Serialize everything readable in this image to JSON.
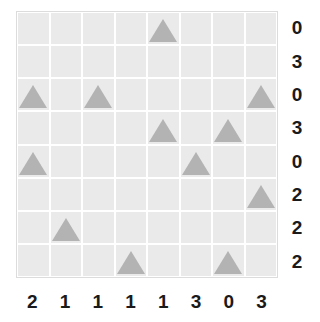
{
  "board": {
    "rows": 8,
    "cols": 8,
    "cell_background": "#eaeaea",
    "gridline_color": "#ffffff",
    "border_color": "#dcdcdc",
    "piece_icon": "triangle-icon",
    "piece_color": "#b3b3b3"
  },
  "row_clues": [
    "0",
    "3",
    "0",
    "3",
    "0",
    "2",
    "2",
    "2"
  ],
  "col_clues": [
    "2",
    "1",
    "1",
    "1",
    "1",
    "3",
    "0",
    "3"
  ],
  "cells": [
    [
      false,
      false,
      false,
      false,
      true,
      false,
      false,
      false
    ],
    [
      false,
      false,
      false,
      false,
      false,
      false,
      false,
      false
    ],
    [
      true,
      false,
      true,
      false,
      false,
      false,
      false,
      true
    ],
    [
      false,
      false,
      false,
      false,
      true,
      false,
      true,
      false
    ],
    [
      true,
      false,
      false,
      false,
      false,
      true,
      false,
      false
    ],
    [
      false,
      false,
      false,
      false,
      false,
      false,
      false,
      true
    ],
    [
      false,
      true,
      false,
      false,
      false,
      false,
      false,
      false
    ],
    [
      false,
      false,
      false,
      true,
      false,
      false,
      true,
      false
    ]
  ],
  "chart_data": {
    "type": "heatmap",
    "title": "",
    "xlabel": "",
    "ylabel": "",
    "grid": true,
    "legend": "none",
    "categories": [
      "c0",
      "c1",
      "c2",
      "c3",
      "c4",
      "c5",
      "c6",
      "c7"
    ],
    "row_labels": [
      "r0",
      "r1",
      "r2",
      "r3",
      "r4",
      "r5",
      "r6",
      "r7"
    ],
    "row_clue_values": [
      0,
      3,
      0,
      3,
      0,
      2,
      2,
      2
    ],
    "col_clue_values": [
      2,
      1,
      1,
      1,
      1,
      3,
      0,
      3
    ],
    "marker": "triangle",
    "marker_count": 12,
    "marker_positions": [
      {
        "row": 0,
        "col": 4
      },
      {
        "row": 2,
        "col": 0
      },
      {
        "row": 2,
        "col": 2
      },
      {
        "row": 2,
        "col": 7
      },
      {
        "row": 3,
        "col": 4
      },
      {
        "row": 3,
        "col": 6
      },
      {
        "row": 4,
        "col": 0
      },
      {
        "row": 4,
        "col": 5
      },
      {
        "row": 5,
        "col": 7
      },
      {
        "row": 6,
        "col": 1
      },
      {
        "row": 7,
        "col": 3
      },
      {
        "row": 7,
        "col": 6
      }
    ],
    "values": [
      [
        0,
        0,
        0,
        0,
        1,
        0,
        0,
        0
      ],
      [
        0,
        0,
        0,
        0,
        0,
        0,
        0,
        0
      ],
      [
        1,
        0,
        1,
        0,
        0,
        0,
        0,
        1
      ],
      [
        0,
        0,
        0,
        0,
        1,
        0,
        1,
        0
      ],
      [
        1,
        0,
        0,
        0,
        0,
        1,
        0,
        0
      ],
      [
        0,
        0,
        0,
        0,
        0,
        0,
        0,
        1
      ],
      [
        0,
        1,
        0,
        0,
        0,
        0,
        0,
        0
      ],
      [
        0,
        0,
        0,
        1,
        0,
        0,
        1,
        0
      ]
    ],
    "row_marker_counts": [
      1,
      0,
      3,
      2,
      2,
      1,
      1,
      2
    ],
    "col_marker_counts": [
      2,
      1,
      1,
      1,
      2,
      1,
      2,
      2
    ]
  }
}
